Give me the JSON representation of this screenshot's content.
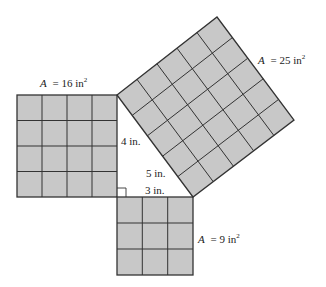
{
  "figure": {
    "colors": {
      "fill": "#c8c8c8",
      "stroke": "#333333",
      "background": "#ffffff"
    },
    "squares": [
      {
        "id": "left",
        "units": 4,
        "area_var": "A",
        "area_eq": "= 16 in",
        "exp": "2"
      },
      {
        "id": "bottom",
        "units": 3,
        "area_var": "A",
        "area_eq": "= 9 in",
        "exp": "2"
      },
      {
        "id": "hyp",
        "units": 5,
        "area_var": "A",
        "area_eq": "= 25 in",
        "exp": "2"
      }
    ],
    "sides": {
      "leg_vertical": "4 in.",
      "leg_horizontal": "3 in.",
      "hypotenuse": "5 in."
    }
  }
}
